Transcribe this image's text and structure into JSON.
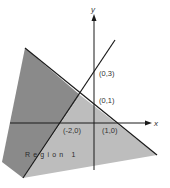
{
  "diagram": {
    "type": "linear-inequality-regions",
    "axes": {
      "x_label": "x",
      "y_label": "y"
    },
    "points": [
      {
        "label": "(0,3)",
        "x": 0,
        "y": 3
      },
      {
        "label": "(0,1)",
        "x": 0,
        "y": 1
      },
      {
        "label": "(-2,0)",
        "x": -2,
        "y": 0
      },
      {
        "label": "(1,0)",
        "x": 1,
        "y": 0
      }
    ],
    "lines": [
      {
        "name": "line through (0,1) and (1,0)",
        "points": [
          "(0,1)",
          "(1,0)"
        ]
      },
      {
        "name": "line through (-2,0) and (0,3)",
        "points": [
          "(-2,0)",
          "(0,3)"
        ]
      }
    ],
    "regions": [
      {
        "label": "Region 1",
        "shade": "light",
        "color": "#bdbdbd"
      },
      {
        "label": "",
        "shade": "dark",
        "color": "#8a8a8a"
      }
    ],
    "colors": {
      "dark_region": "#8a8a8a",
      "light_region": "#bdbdbd",
      "line": "#1a1a1a",
      "background": "#ffffff"
    }
  }
}
